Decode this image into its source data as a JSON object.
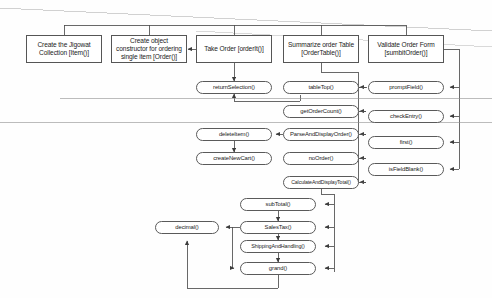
{
  "diagram": {
    "type": "structure-chart",
    "colors": {
      "node_border": "#4a4a4a",
      "node_fill": "#ffffff",
      "line": "#4d4d4d",
      "text": "#1b1b1b",
      "background": "#fefefe",
      "artifact_line": "#b9b9b9"
    },
    "modules": [
      {
        "id": "create-collection",
        "label": "Create the Jigowat Collection [Item()]",
        "shape": "rect",
        "x": 26,
        "y": 35,
        "w": 76,
        "h": 28
      },
      {
        "id": "create-constructor",
        "label": "Create object constructor for ordering single item [Order()]",
        "shape": "rect",
        "x": 111,
        "y": 35,
        "w": 76,
        "h": 28
      },
      {
        "id": "take-order",
        "label": "Take Order [orderIt()]",
        "shape": "rect",
        "x": 196,
        "y": 35,
        "w": 76,
        "h": 28
      },
      {
        "id": "summarize-order-table",
        "label": "Summarize order Table [OrderTable()]",
        "shape": "rect",
        "x": 283,
        "y": 35,
        "w": 76,
        "h": 28
      },
      {
        "id": "validate-order-form",
        "label": "Validate Order Form [sumbitOrder()]",
        "shape": "rect",
        "x": 368,
        "y": 35,
        "w": 76,
        "h": 28
      }
    ],
    "routines": [
      {
        "id": "return-selection",
        "label": "returnSelection()",
        "shape": "pill",
        "x": 196,
        "y": 81,
        "w": 76,
        "h": 13
      },
      {
        "id": "delete-item",
        "label": "deleteItem()",
        "shape": "pill",
        "x": 196,
        "y": 128,
        "w": 76,
        "h": 13
      },
      {
        "id": "create-new-cart",
        "label": "createNewCart()",
        "shape": "pill",
        "x": 196,
        "y": 152,
        "w": 76,
        "h": 13
      },
      {
        "id": "table-top",
        "label": "tableTop()",
        "shape": "pill",
        "x": 283,
        "y": 81,
        "w": 76,
        "h": 13
      },
      {
        "id": "get-order-count",
        "label": "getOrderCount()",
        "shape": "pill",
        "x": 283,
        "y": 105,
        "w": 76,
        "h": 13
      },
      {
        "id": "parse-and-display-order",
        "label": "ParseAndDisplayOrder()",
        "shape": "pill",
        "x": 283,
        "y": 128,
        "w": 76,
        "h": 13
      },
      {
        "id": "no-order",
        "label": "noOrder()",
        "shape": "pill",
        "x": 283,
        "y": 152,
        "w": 76,
        "h": 13
      },
      {
        "id": "calculate-and-display-total",
        "label": "CalculateAndDisplayTotal()",
        "shape": "pill",
        "x": 283,
        "y": 176,
        "w": 76,
        "h": 13
      },
      {
        "id": "prompt-field",
        "label": "promptField()",
        "shape": "pill",
        "x": 368,
        "y": 81,
        "w": 76,
        "h": 13
      },
      {
        "id": "check-entry",
        "label": "checkEntry()",
        "shape": "pill",
        "x": 368,
        "y": 110,
        "w": 76,
        "h": 13
      },
      {
        "id": "first",
        "label": "first()",
        "shape": "pill",
        "x": 368,
        "y": 136,
        "w": 76,
        "h": 13
      },
      {
        "id": "is-field-blank",
        "label": "isFieldBlank()",
        "shape": "pill",
        "x": 368,
        "y": 163,
        "w": 76,
        "h": 13
      },
      {
        "id": "sub-total",
        "label": "subTotal()",
        "shape": "pill",
        "x": 240,
        "y": 198,
        "w": 76,
        "h": 13
      },
      {
        "id": "sales-tax",
        "label": "SalesTax()",
        "shape": "pill",
        "x": 240,
        "y": 221,
        "w": 76,
        "h": 13
      },
      {
        "id": "shipping-and-handling",
        "label": "ShippingAndHandling()",
        "shape": "pill",
        "x": 240,
        "y": 240,
        "w": 76,
        "h": 13
      },
      {
        "id": "grand",
        "label": "grand()",
        "shape": "pill",
        "x": 240,
        "y": 262,
        "w": 76,
        "h": 13
      },
      {
        "id": "decimal",
        "label": "decimal()",
        "shape": "pill",
        "x": 155,
        "y": 221,
        "w": 64,
        "h": 13
      }
    ]
  }
}
